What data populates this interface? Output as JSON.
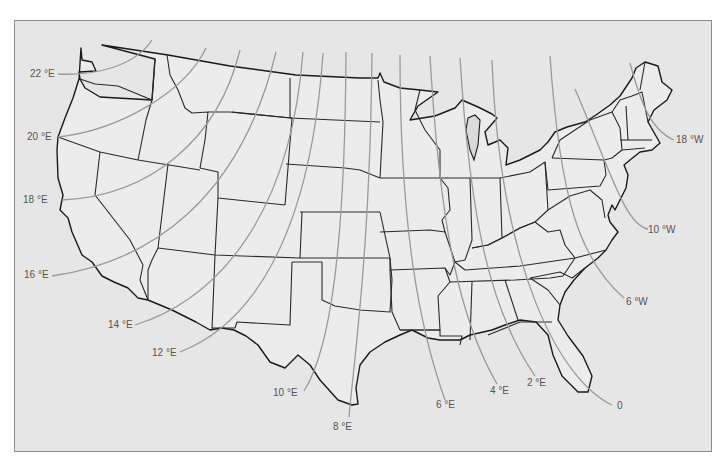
{
  "map": {
    "title": "Isogonic lines of magnetic declination, contiguous United States",
    "colors": {
      "background": "#e6e6e6",
      "land": "#ececec",
      "border": "#1a1a1a",
      "isogonic_line": "#9a9a9a",
      "label": "#555555"
    },
    "isogonic_lines": [
      {
        "label": "22 °E",
        "value": "22E",
        "lx": 30,
        "ly": 77,
        "d": "M58,74 C95,76 135,66 152,40"
      },
      {
        "label": "20 °E",
        "value": "20E",
        "lx": 27,
        "ly": 140,
        "d": "M58,137 C120,130 185,92 206,48"
      },
      {
        "label": "18 °E",
        "value": "18E",
        "lx": 23,
        "ly": 203,
        "d": "M62,200 C150,196 218,140 240,50"
      },
      {
        "label": "16 °E",
        "value": "16E",
        "lx": 24,
        "ly": 278,
        "d": "M52,276 C150,262 240,200 276,52"
      },
      {
        "label": "14 °E",
        "value": "14E",
        "lx": 108,
        "ly": 328,
        "d": "M135,325 C215,300 290,220 303,52"
      },
      {
        "label": "12 °E",
        "value": "12E",
        "lx": 152,
        "ly": 356,
        "d": "M180,352 C250,325 310,240 323,53"
      },
      {
        "label": "10 °E",
        "value": "10E",
        "lx": 273,
        "ly": 396,
        "d": "M304,391 C330,350 345,250 346,52"
      },
      {
        "label": "8 °E",
        "value": "8E",
        "lx": 333,
        "ly": 430,
        "d": "M349,417 C355,350 370,250 372,53"
      },
      {
        "label": "6 °E",
        "value": "6E",
        "lx": 436,
        "ly": 408,
        "d": "M445,400 C420,330 400,230 400,55"
      },
      {
        "label": "4 °E",
        "value": "4E",
        "lx": 490,
        "ly": 394,
        "d": "M497,384 C460,320 440,230 430,56"
      },
      {
        "label": "2 °E",
        "value": "2E",
        "lx": 527,
        "ly": 386,
        "d": "M535,376 C490,310 470,220 460,58"
      },
      {
        "label": "0",
        "value": "0",
        "lx": 617,
        "ly": 409,
        "d": "M612,405 C560,380 500,270 492,60"
      },
      {
        "label": "6 °W",
        "value": "6W",
        "lx": 626,
        "ly": 305,
        "d": "M624,298 C580,260 560,200 550,56"
      },
      {
        "label": "10 °W",
        "value": "10W",
        "lx": 648,
        "ly": 233,
        "d": "M648,229 C625,225 610,170 575,89"
      },
      {
        "label": "18 °W",
        "value": "18W",
        "lx": 676,
        "ly": 143,
        "d": "M674,140 C650,130 640,100 630,63"
      }
    ]
  }
}
